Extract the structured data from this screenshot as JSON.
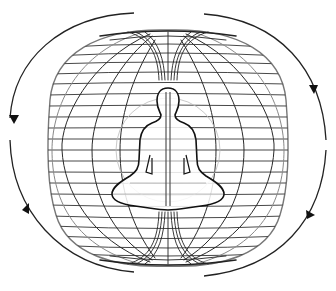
{
  "figure": {
    "colors": {
      "background": "#ffffff",
      "line": "#2a2a2a",
      "grid_light": "#8a8a8a",
      "figure_outline": "#111111"
    },
    "torus": {
      "cx": 168,
      "cy": 145,
      "rx": 118,
      "ry": 112,
      "meridians": 12,
      "parallels": 22
    },
    "arrows": [
      {
        "position": "upper-left",
        "direction": "counter-clockwise"
      },
      {
        "position": "upper-right",
        "direction": "clockwise"
      },
      {
        "position": "lower-left",
        "direction": "down"
      },
      {
        "position": "lower-right",
        "direction": "up"
      }
    ]
  }
}
